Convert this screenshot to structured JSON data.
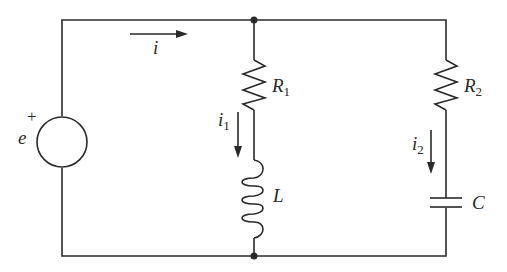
{
  "diagram": {
    "type": "circuit",
    "source": {
      "name": "e",
      "polarity_mark": "+"
    },
    "main_current": {
      "symbol": "i"
    },
    "branch1": {
      "resistor": {
        "symbol": "R",
        "subscript": "1"
      },
      "inductor": {
        "symbol": "L"
      },
      "current": {
        "symbol": "i",
        "subscript": "1"
      }
    },
    "branch2": {
      "resistor": {
        "symbol": "R",
        "subscript": "2"
      },
      "capacitor": {
        "symbol": "C"
      },
      "current": {
        "symbol": "i",
        "subscript": "2"
      }
    },
    "colors": {
      "line": "#2a2a2a",
      "background": "#ffffff"
    }
  }
}
